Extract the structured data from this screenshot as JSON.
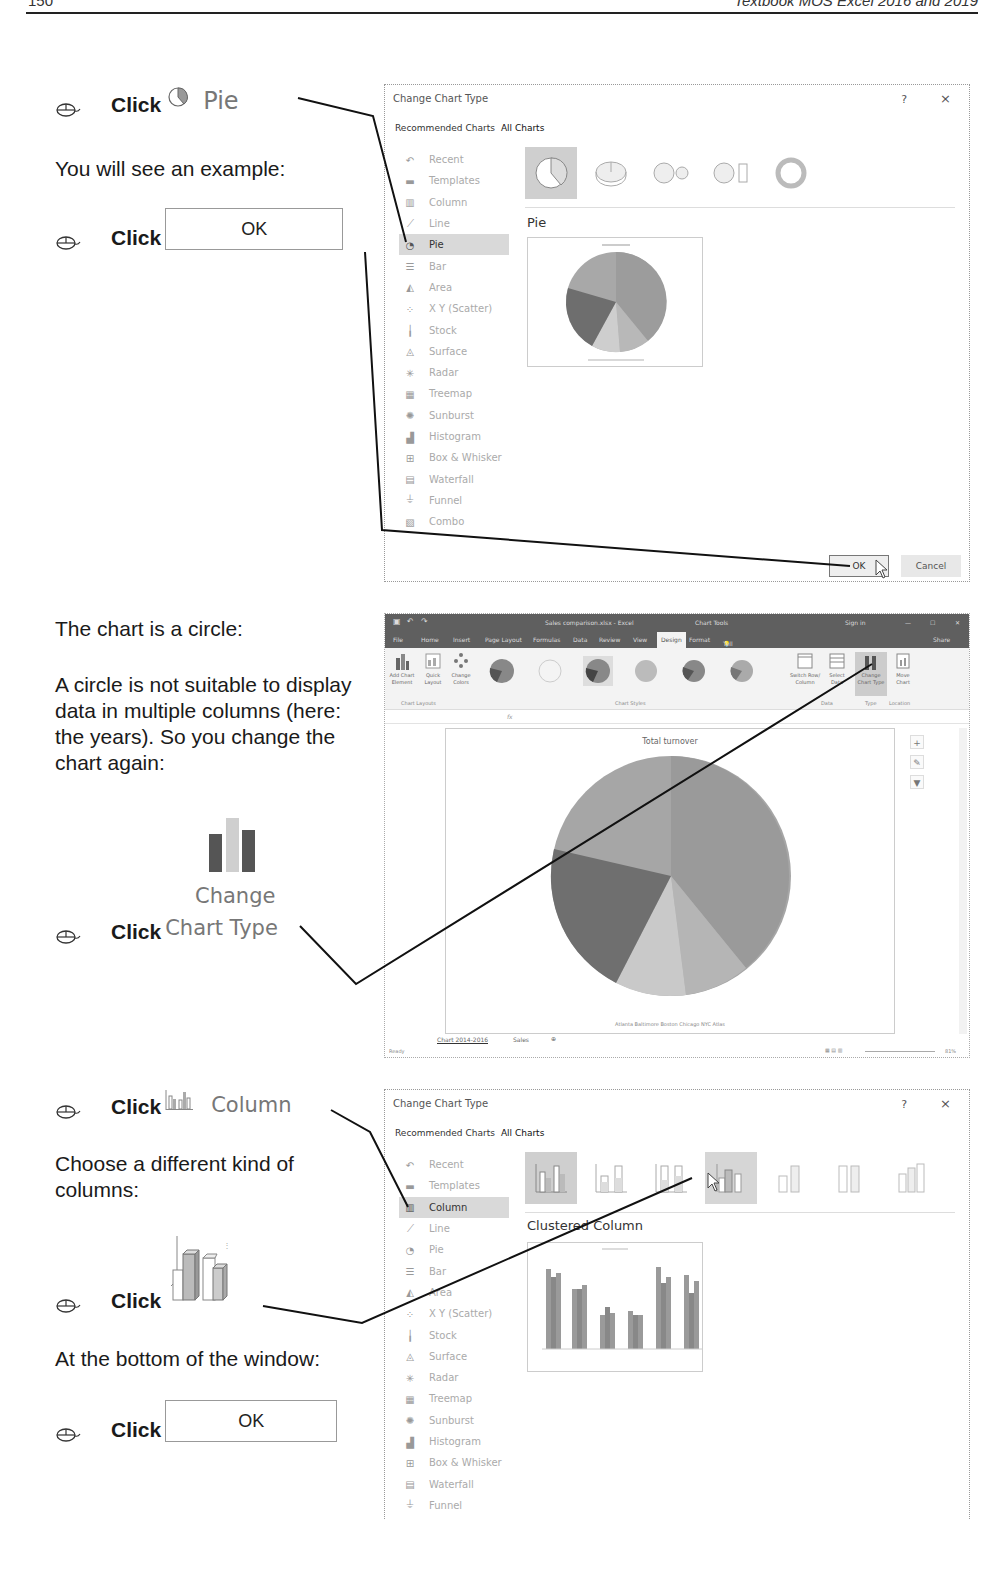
{
  "page_header": {
    "page_number": "150",
    "book_title": "Textbook MOS Excel 2016 and 2019"
  },
  "left_column": {
    "step1": {
      "click": "Click",
      "icon": "pie-chart-icon",
      "label": "Pie"
    },
    "text1": "You will see an example:",
    "step2": {
      "click": "Click",
      "button_label": "OK"
    },
    "text2": "The chart is a circle:",
    "text3": "A circle is not suitable to display data in multiple columns (here: the years). So you change the chart again:",
    "step3": {
      "click": "Click",
      "icon": "change-chart-type-icon",
      "label_line1": "Change",
      "label_line2": "Chart Type"
    },
    "step4": {
      "click": "Click",
      "icon": "column-chart-icon",
      "label": "Column"
    },
    "text4": "Choose a different kind of columns:",
    "step5": {
      "click": "Click",
      "icon": "3d-clustered-column-icon"
    },
    "text5": "At the bottom of the window:",
    "step6": {
      "click": "Click",
      "button_label": "OK"
    }
  },
  "dialog1": {
    "title": "Change Chart Type",
    "help": "?",
    "close": "×",
    "tabs": [
      "Recommended Charts",
      "All Charts"
    ],
    "chart_types": [
      "Recent",
      "Templates",
      "Column",
      "Line",
      "Pie",
      "Bar",
      "Area",
      "X Y (Scatter)",
      "Stock",
      "Surface",
      "Radar",
      "Treemap",
      "Sunburst",
      "Histogram",
      "Box & Whisker",
      "Waterfall",
      "Funnel",
      "Combo"
    ],
    "selected_type": "Pie",
    "variant_title": "Pie",
    "ok_label": "OK",
    "cancel_label": "Cancel"
  },
  "excel_window": {
    "file_title": "Sales comparison.xlsx - Excel",
    "context_title": "Chart Tools",
    "sign_in": "Sign in",
    "ribbon_tabs": [
      "File",
      "Home",
      "Insert",
      "Page Layout",
      "Formulas",
      "Data",
      "Review",
      "View",
      "Design",
      "Format"
    ],
    "active_tab": "Design",
    "tell_me": "Tell me what you want to do",
    "share": "Share",
    "ribbon_buttons": {
      "add_chart_element": "Add Chart Element",
      "quick_layout": "Quick Layout",
      "change_colors": "Change Colors",
      "switch_row_column": "Switch Row/ Column",
      "select_data": "Select Data",
      "change_chart_type": "Change Chart Type",
      "move_chart": "Move Chart"
    },
    "groups": [
      "Chart Layouts",
      "Chart Styles",
      "Data",
      "Type",
      "Location"
    ],
    "fx_label": "fx",
    "chart_title": "Total turnover",
    "legend": "Atlanta  Baltimore  Boston  Chicago  NYC  Atlas",
    "sheet_tabs": [
      "Chart 2014-2016",
      "Sales"
    ],
    "status": "Ready",
    "zoom": "81%"
  },
  "dialog2": {
    "title": "Change Chart Type",
    "help": "?",
    "close": "×",
    "tabs": [
      "Recommended Charts",
      "All Charts"
    ],
    "chart_types": [
      "Recent",
      "Templates",
      "Column",
      "Line",
      "Pie",
      "Bar",
      "Area",
      "X Y (Scatter)",
      "Stock",
      "Surface",
      "Radar",
      "Treemap",
      "Sunburst",
      "Histogram",
      "Box & Whisker",
      "Waterfall",
      "Funnel"
    ],
    "selected_type": "Column",
    "variant_title": "Clustered Column"
  },
  "colors": {
    "text": "#1a1a1a",
    "ui_gray": "#777777",
    "excel_titlebar": "#5f5f5f",
    "selection": "#d9d9d9"
  }
}
